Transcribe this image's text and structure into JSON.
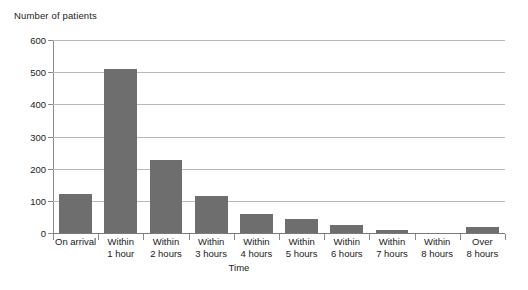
{
  "chart_data": {
    "type": "bar",
    "title": "",
    "ylabel": "Number of patients",
    "xlabel": "Time",
    "categories": [
      "On arrival",
      "Within\n1 hour",
      "Within\n2 hours",
      "Within\n3 hours",
      "Within\n4 hours",
      "Within\n5 hours",
      "Within\n6 hours",
      "Within\n7 hours",
      "Within\n8 hours",
      "Over\n8 hours"
    ],
    "values": [
      122,
      510,
      227,
      116,
      60,
      45,
      26,
      8,
      0,
      18
    ],
    "ylim": [
      0,
      600
    ],
    "yticks": [
      0,
      100,
      200,
      300,
      400,
      500,
      600
    ],
    "ytick_labels": [
      "0",
      "100",
      "200",
      "300",
      "400",
      "500",
      "600"
    ],
    "grid": true,
    "legend": false,
    "bar_color": "#6e6e6e",
    "grid_color": "#b9b9b9",
    "axis_color": "#8a8a8a",
    "text_color": "#1a1a1a"
  }
}
